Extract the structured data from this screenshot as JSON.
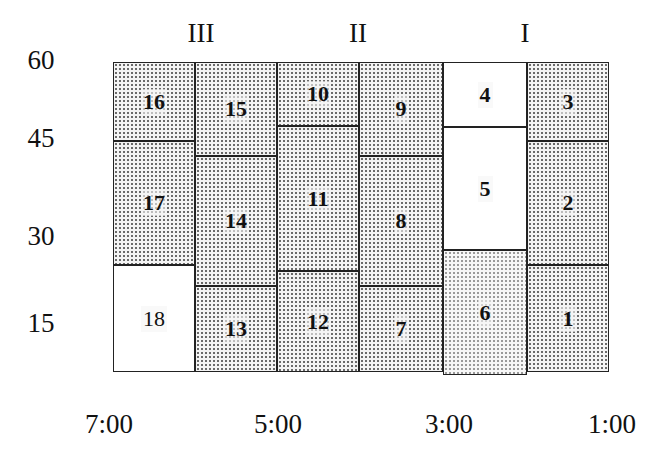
{
  "diagram": {
    "top_labels": [
      {
        "text": "III",
        "x": 201,
        "y": 33
      },
      {
        "text": "II",
        "x": 358,
        "y": 33
      },
      {
        "text": "I",
        "x": 525,
        "y": 33
      }
    ],
    "y_axis_labels": [
      {
        "text": "60",
        "x": 41,
        "y": 60
      },
      {
        "text": "45",
        "x": 41,
        "y": 138
      },
      {
        "text": "30",
        "x": 41,
        "y": 236
      },
      {
        "text": "15",
        "x": 41,
        "y": 323
      }
    ],
    "x_axis_labels": [
      {
        "text": "7:00",
        "x": 109,
        "y": 424
      },
      {
        "text": "5:00",
        "x": 278,
        "y": 424
      },
      {
        "text": "3:00",
        "x": 449,
        "y": 424
      },
      {
        "text": "1:00",
        "x": 612,
        "y": 424
      }
    ],
    "cells": [
      {
        "label": "16",
        "x": 113,
        "y": 62,
        "w": 82,
        "h": 79,
        "fill": "dots"
      },
      {
        "label": "17",
        "x": 113,
        "y": 141,
        "w": 82,
        "h": 124,
        "fill": "dots"
      },
      {
        "label": "18",
        "x": 113,
        "y": 265,
        "w": 82,
        "h": 107,
        "fill": "plain",
        "weight": "normal"
      },
      {
        "label": "15",
        "x": 195,
        "y": 62,
        "w": 82,
        "h": 94,
        "fill": "dots"
      },
      {
        "label": "14",
        "x": 195,
        "y": 156,
        "w": 82,
        "h": 130,
        "fill": "dots"
      },
      {
        "label": "13",
        "x": 195,
        "y": 286,
        "w": 82,
        "h": 86,
        "fill": "dots"
      },
      {
        "label": "10",
        "x": 277,
        "y": 62,
        "w": 82,
        "h": 64,
        "fill": "dots"
      },
      {
        "label": "11",
        "x": 277,
        "y": 126,
        "w": 82,
        "h": 145,
        "fill": "dots"
      },
      {
        "label": "12",
        "x": 277,
        "y": 271,
        "w": 82,
        "h": 101,
        "fill": "dots"
      },
      {
        "label": "9",
        "x": 359,
        "y": 62,
        "w": 84,
        "h": 94,
        "fill": "dots"
      },
      {
        "label": "8",
        "x": 359,
        "y": 156,
        "w": 84,
        "h": 130,
        "fill": "dots"
      },
      {
        "label": "7",
        "x": 359,
        "y": 286,
        "w": 84,
        "h": 86,
        "fill": "dots"
      },
      {
        "label": "4",
        "x": 443,
        "y": 62,
        "w": 84,
        "h": 65,
        "fill": "plain"
      },
      {
        "label": "5",
        "x": 443,
        "y": 127,
        "w": 84,
        "h": 123,
        "fill": "plain"
      },
      {
        "label": "6",
        "x": 443,
        "y": 250,
        "w": 84,
        "h": 125,
        "fill": "dots-light"
      },
      {
        "label": "3",
        "x": 527,
        "y": 62,
        "w": 82,
        "h": 79,
        "fill": "dots"
      },
      {
        "label": "2",
        "x": 527,
        "y": 141,
        "w": 82,
        "h": 124,
        "fill": "dots"
      },
      {
        "label": "1",
        "x": 527,
        "y": 265,
        "w": 82,
        "h": 107,
        "fill": "dots"
      }
    ]
  }
}
